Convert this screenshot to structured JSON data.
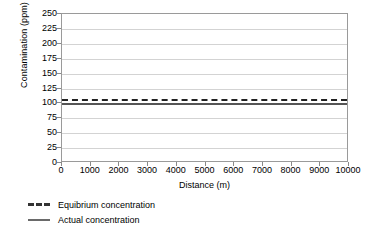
{
  "chart_data": {
    "type": "line",
    "title": "",
    "xlabel": "Distance (m)",
    "ylabel": "Contamination (ppm)",
    "xlim": [
      0,
      10000
    ],
    "ylim": [
      0,
      250
    ],
    "xticks": [
      0,
      1000,
      2000,
      3000,
      4000,
      5000,
      6000,
      7000,
      8000,
      9000,
      10000
    ],
    "yticks": [
      0,
      25,
      50,
      75,
      100,
      125,
      150,
      175,
      200,
      225,
      250
    ],
    "xtick_labels": [
      "0",
      "1000",
      "2000",
      "3000",
      "4000",
      "5000",
      "6000",
      "7000",
      "8000",
      "9000",
      "10000"
    ],
    "ytick_labels": [
      "0",
      "25",
      "50",
      "75",
      "100",
      "125",
      "150",
      "175",
      "200",
      "225",
      "250"
    ],
    "grid": {
      "horizontal": true,
      "vertical": false,
      "color": "#d3d3d3"
    },
    "legend_position": "below-left",
    "series": [
      {
        "name": "Equibrium concentration",
        "style": "dashed",
        "color": "#222222",
        "x": [
          0,
          1000,
          2000,
          3000,
          4000,
          5000,
          6000,
          7000,
          8000,
          9000,
          10000
        ],
        "values": [
          108,
          108,
          108,
          108,
          108,
          108,
          108,
          108,
          108,
          108,
          108
        ]
      },
      {
        "name": "Actual concentration",
        "style": "solid",
        "color": "#555555",
        "x": [
          0,
          1000,
          2000,
          3000,
          4000,
          5000,
          6000,
          7000,
          8000,
          9000,
          10000
        ],
        "values": [
          101,
          101,
          101,
          101,
          101,
          101,
          101,
          101,
          101,
          101,
          101
        ]
      }
    ]
  },
  "legend": {
    "items": [
      {
        "label": "Equibrium concentration",
        "style": "dashed"
      },
      {
        "label": "Actual concentration",
        "style": "solid"
      }
    ]
  },
  "colors": {
    "axis": "#9a9a9a",
    "grid": "#d3d3d3",
    "equilibrium": "#222222",
    "actual": "#555555",
    "text": "#000000",
    "background": "#ffffff"
  }
}
